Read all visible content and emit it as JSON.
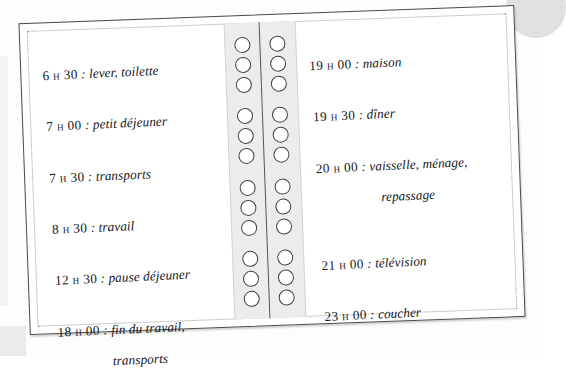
{
  "document": {
    "kind": "spiral-bound notebook spread",
    "language": "French",
    "background_color": "#fdfdfc",
    "ink_color": "#15151a",
    "frame_color": "#4a4a4a",
    "binding_color": "#ececec",
    "ring_outline_color": "#3f3f3f"
  },
  "binding": {
    "ring_groups": 4,
    "rings_per_group": 3,
    "columns": 2
  },
  "left_page": {
    "entries": [
      {
        "time": "6 h 30",
        "separator": " : ",
        "activity": "lever, toilette",
        "continuation": ""
      },
      {
        "time": "7 h 00",
        "separator": " : ",
        "activity": "petit déjeuner",
        "continuation": ""
      },
      {
        "time": "7 h 30",
        "separator": " : ",
        "activity": "transports",
        "continuation": ""
      },
      {
        "time": "8 h 30",
        "separator": " : ",
        "activity": "travail",
        "continuation": ""
      },
      {
        "time": "12 h 30",
        "separator": " : ",
        "activity": "pause déjeuner",
        "continuation": ""
      },
      {
        "time": "18 h 00",
        "separator": " : ",
        "activity": "fin du travail,",
        "continuation": "transports"
      }
    ]
  },
  "right_page": {
    "entries": [
      {
        "time": "19 h 00",
        "separator": " : ",
        "activity": "maison",
        "continuation": ""
      },
      {
        "time": "19 h 30",
        "separator": " : ",
        "activity": "dîner",
        "continuation": ""
      },
      {
        "time": "20 h 00",
        "separator": " : ",
        "activity": "vaisselle, ménage,",
        "continuation": "repassage"
      },
      {
        "time": "21 h 00",
        "separator": " : ",
        "activity": "télévision",
        "continuation": ""
      },
      {
        "time": "23 h 00",
        "separator": " : ",
        "activity": "coucher",
        "continuation": ""
      }
    ]
  }
}
